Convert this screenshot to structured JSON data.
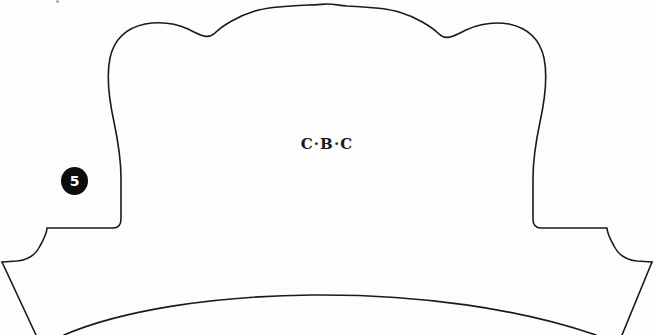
{
  "document": {
    "kind": "line-drawing",
    "background_color": "#fdfdfd",
    "ink_color": "#1a1a1a",
    "width": 654,
    "height": 335
  },
  "annotations": {
    "center_label": "C·B·C",
    "callout": {
      "number": "5",
      "shape": "filled-circle",
      "fill_color": "#0d0d0d",
      "text_color": "#ffffff"
    }
  },
  "drawing": {
    "title": "chair-back-outline",
    "stroke_width": 1.6,
    "parts": [
      {
        "name": "crown-and-body-outline",
        "description": "Scalloped crown with central crest, two shoulder peaks, descending side stiles, seat ledges and flaring lower rails",
        "path": "M 2 262 L 17 261 C 28 260 36 254 40 246 C 45 237 47 231 47 228 L 113 228 C 118 228 121 225 121 219 L 121 178 C 121 158 118 141 114 122 C 109 99 106 77 110 58 C 114 40 126 28 145 24 C 163 21 177 24 188 29 C 200 35 208 40 215 33 C 222 26 238 16 255 11 C 272 6 292 6 308 5 C 318 5 323 4 327 4 C 332 4 337 5 347 6 C 363 7 382 7 399 12 C 416 17 432 27 439 34 C 446 41 454 36 466 30 C 477 25 491 21 509 24 C 528 28 540 40 544 58 C 548 77 545 99 540 122 C 536 141 533 158 533 178 L 533 219 C 533 225 536 228 541 228 L 607 228 C 607 231 609 237 614 246 C 618 254 626 260 637 261 L 652 262"
      },
      {
        "name": "seat-front-arc",
        "description": "Broad shallow arc spanning the lower portion, apex near center",
        "path": "M 64 335 C 120 311 210 296 312 295 C 420 294 520 309 596 335"
      },
      {
        "name": "lower-left-rail",
        "description": "Near vertical line from left ledge toward bottom edge",
        "path": "M 2 262 L 36 335"
      },
      {
        "name": "lower-right-rail",
        "description": "Near vertical line from right ledge toward bottom edge",
        "path": "M 652 262 L 622 335"
      }
    ]
  }
}
